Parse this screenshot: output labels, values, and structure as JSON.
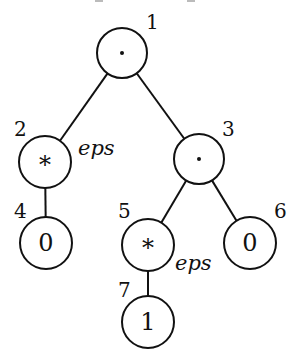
{
  "diagram": {
    "type": "syntax-tree",
    "nodes": [
      {
        "id": "1",
        "symbol": "·",
        "kind": "concat",
        "annotation": ""
      },
      {
        "id": "2",
        "symbol": "*",
        "kind": "star",
        "annotation": "eps"
      },
      {
        "id": "3",
        "symbol": "·",
        "kind": "concat",
        "annotation": ""
      },
      {
        "id": "4",
        "symbol": "0",
        "kind": "leaf",
        "annotation": ""
      },
      {
        "id": "5",
        "symbol": "*",
        "kind": "star",
        "annotation": "eps"
      },
      {
        "id": "6",
        "symbol": "0",
        "kind": "leaf",
        "annotation": ""
      },
      {
        "id": "7",
        "symbol": "1",
        "kind": "leaf",
        "annotation": ""
      }
    ],
    "edges": [
      {
        "from": "1",
        "to": "2"
      },
      {
        "from": "1",
        "to": "3"
      },
      {
        "from": "2",
        "to": "4"
      },
      {
        "from": "3",
        "to": "5"
      },
      {
        "from": "3",
        "to": "6"
      },
      {
        "from": "5",
        "to": "7"
      }
    ]
  }
}
